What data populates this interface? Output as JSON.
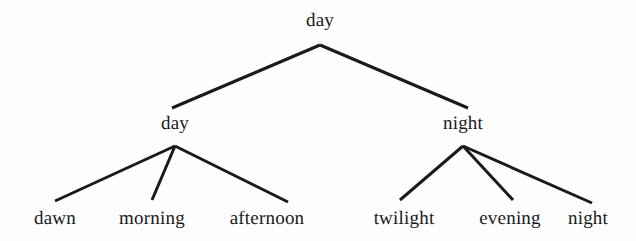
{
  "figure": {
    "type": "tree-diagram",
    "title": "day",
    "background_color": "#fdfdfd",
    "line_color": "#1a1a1a",
    "text_color": "#1a1a1a"
  },
  "tree": {
    "root": {
      "label": "day",
      "x": 320,
      "y": 20
    },
    "level2": [
      {
        "label": "day",
        "x": 175,
        "y": 123
      },
      {
        "label": "night",
        "x": 463,
        "y": 123
      }
    ],
    "leaves": [
      {
        "label": "dawn",
        "x": 55,
        "y": 218,
        "parent": "day"
      },
      {
        "label": "morning",
        "x": 152,
        "y": 218,
        "parent": "day"
      },
      {
        "label": "afternoon",
        "x": 267,
        "y": 218,
        "parent": "day"
      },
      {
        "label": "twilight",
        "x": 404,
        "y": 218,
        "parent": "night"
      },
      {
        "label": "evening",
        "x": 510,
        "y": 218,
        "parent": "night"
      },
      {
        "label": "night",
        "x": 588,
        "y": 218,
        "parent": "night"
      }
    ]
  },
  "edges": [
    {
      "name": "root-to-day",
      "x1": 320,
      "y1": 45,
      "x2": 172,
      "y2": 108
    },
    {
      "name": "root-to-night",
      "x1": 320,
      "y1": 45,
      "x2": 468,
      "y2": 108
    },
    {
      "name": "day-to-dawn",
      "x1": 175,
      "y1": 146,
      "x2": 55,
      "y2": 201
    },
    {
      "name": "day-to-morning",
      "x1": 175,
      "y1": 146,
      "x2": 152,
      "y2": 200
    },
    {
      "name": "day-to-afternoon",
      "x1": 175,
      "y1": 146,
      "x2": 288,
      "y2": 202
    },
    {
      "name": "night-to-twilight",
      "x1": 463,
      "y1": 146,
      "x2": 400,
      "y2": 200
    },
    {
      "name": "night-to-evening",
      "x1": 463,
      "y1": 146,
      "x2": 513,
      "y2": 200
    },
    {
      "name": "night-to-night",
      "x1": 463,
      "y1": 146,
      "x2": 592,
      "y2": 203
    }
  ]
}
